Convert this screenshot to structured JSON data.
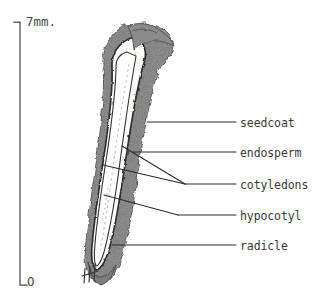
{
  "figure": {
    "background_color": "#ffffff",
    "ink_color": "#2b2b2b",
    "scale_bar": {
      "top_label": "7mm.",
      "bottom_label": "O",
      "orientation": "vertical",
      "top_y": 22,
      "bottom_y": 285,
      "x": 20
    },
    "specimen": {
      "name": "seed",
      "seedcoat_fill": "#9a9a9a",
      "endosperm_fill": "#fbfbf9",
      "embryo_fill": "#ffffff",
      "tally_marks": "|||/"
    },
    "labels": [
      {
        "id": "seedcoat",
        "text": "seedcoat",
        "dash": "—",
        "x": 240,
        "y": 116,
        "leader_y": 122,
        "leader_end_x": 147
      },
      {
        "id": "endosperm",
        "text": "endosperm",
        "dash": "—",
        "x": 240,
        "y": 146,
        "leader_y": 152,
        "leader_end_x": 133
      },
      {
        "id": "cotyledons",
        "text": "cotyledons",
        "dash": "—",
        "x": 240,
        "y": 178,
        "leader_y": 184,
        "leader_end_x": 185
      },
      {
        "id": "hypocotyl",
        "text": "hypocotyl",
        "dash": "—",
        "x": 240,
        "y": 209,
        "leader_y": 215,
        "leader_end_x": 178
      },
      {
        "id": "radicle",
        "text": "radicle",
        "dash": "—",
        "x": 240,
        "y": 239,
        "leader_y": 245,
        "leader_end_x": 112
      }
    ]
  }
}
